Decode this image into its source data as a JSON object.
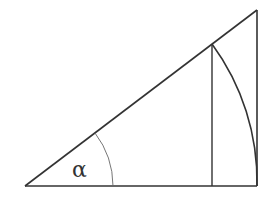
{
  "diagram": {
    "type": "geometry",
    "angle_label": "α",
    "colors": {
      "stroke": "#333333",
      "thin_stroke": "#666666",
      "background": "#ffffff"
    },
    "vertices": {
      "origin": [
        25,
        186
      ],
      "base_right": [
        257,
        186
      ],
      "top": [
        257,
        10
      ],
      "inner_top": [
        212,
        44
      ],
      "inner_bottom": [
        212,
        186
      ]
    },
    "arcs": {
      "angle_arc_radius": 88,
      "large_arc_radius": 232
    }
  }
}
